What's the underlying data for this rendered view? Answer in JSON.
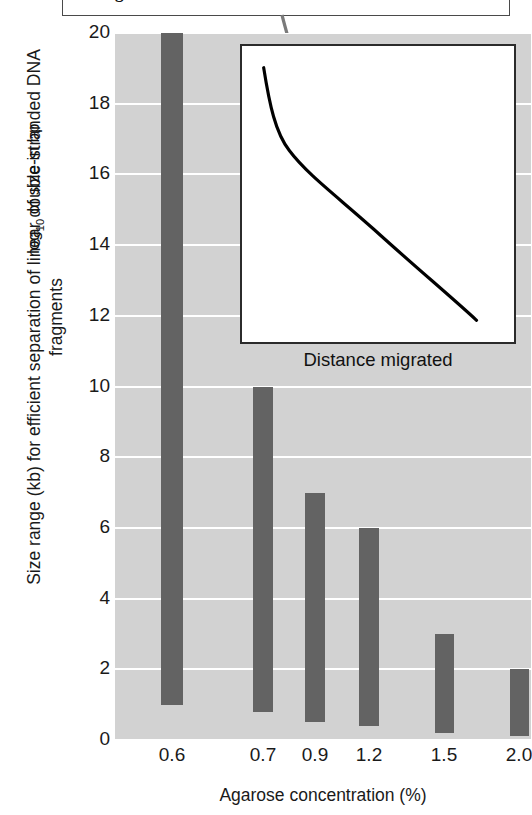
{
  "callout": {
    "text": "of fragment size"
  },
  "axes": {
    "y_title": "Size range (kb) for efficient separation of linear double-stranded DNA fragments",
    "x_title": "Agarose concentration (%)",
    "y_ticks": [
      "20",
      "18",
      "16",
      "14",
      "12",
      "10",
      "8",
      "6",
      "4",
      "2",
      "0"
    ],
    "x_ticks": [
      "0.6",
      "0.7",
      "0.9",
      "1.2",
      "1.5",
      "2.0"
    ]
  },
  "inset": {
    "y_label_prefix": "log",
    "y_label_sub": "10",
    "y_label_suffix": " of size in bp",
    "x_label": "Distance migrated"
  },
  "colors": {
    "bar": "#636363",
    "plot_background": "#d2d2d2",
    "gridline": "#ffffff",
    "leader_line": "#7a7a7a",
    "curve": "#000000"
  },
  "chart_data": {
    "type": "bar",
    "title": "",
    "subtitle": "",
    "xlabel": "Agarose concentration (%)",
    "ylabel": "Size range (kb) for efficient separation of linear double-stranded DNA fragments",
    "categories": [
      "0.6",
      "0.7",
      "0.9",
      "1.2",
      "1.5",
      "2.0"
    ],
    "bar_style": "range",
    "ylim": [
      0,
      20
    ],
    "xlim_note": "categorical, unevenly spaced by concentration value",
    "grid": true,
    "legend": "none",
    "ranges": [
      {
        "category": "0.6",
        "low": 1.0,
        "high": 20.0
      },
      {
        "category": "0.7",
        "low": 0.8,
        "high": 10.0
      },
      {
        "category": "0.9",
        "low": 0.5,
        "high": 7.0
      },
      {
        "category": "1.2",
        "low": 0.4,
        "high": 6.0
      },
      {
        "category": "1.5",
        "low": 0.2,
        "high": 3.0
      },
      {
        "category": "2.0",
        "low": 0.1,
        "high": 2.0
      }
    ],
    "values": [
      20.0,
      10.0,
      7.0,
      6.0,
      3.0,
      2.0
    ],
    "ytick_values": [
      0,
      2,
      4,
      6,
      8,
      10,
      12,
      14,
      16,
      18,
      20
    ],
    "inset_chart": {
      "type": "line",
      "xlabel": "Distance migrated",
      "ylabel": "log10 of size in bp",
      "description": "Monotonically decreasing calibration curve, steep at left, near-linear through middle and right",
      "annotation_point": {
        "x_frac": 0.31,
        "y_frac": 0.49
      }
    }
  },
  "bar_geometry": {
    "plot": {
      "left": 115,
      "top": 33,
      "width": 416,
      "height": 707
    },
    "bars": [
      {
        "category": "0.6",
        "x": 46,
        "w": 22,
        "top_val": 20.0,
        "bot_val": 1.0
      },
      {
        "category": "0.7",
        "x": 138,
        "w": 20,
        "top_val": 10.0,
        "bot_val": 0.8
      },
      {
        "category": "0.9",
        "x": 190,
        "w": 20,
        "top_val": 7.0,
        "bot_val": 0.5
      },
      {
        "category": "1.2",
        "x": 244,
        "w": 20,
        "top_val": 6.0,
        "bot_val": 0.4
      },
      {
        "category": "1.5",
        "x": 320,
        "w": 19,
        "top_val": 3.0,
        "bot_val": 0.2
      },
      {
        "category": "2.0",
        "x": 395,
        "w": 19,
        "top_val": 2.0,
        "bot_val": 0.1
      }
    ],
    "xtick_centers": [
      57,
      148,
      200,
      254,
      329,
      404
    ]
  }
}
